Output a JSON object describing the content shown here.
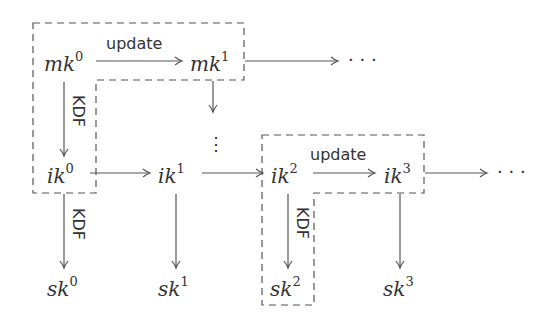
{
  "nodes": {
    "mk0": {
      "base": "mk",
      "sup": "0"
    },
    "mk1": {
      "base": "mk",
      "sup": "1"
    },
    "ik0": {
      "base": "ik",
      "sup": "0"
    },
    "ik1": {
      "base": "ik",
      "sup": "1"
    },
    "ik2": {
      "base": "ik",
      "sup": "2"
    },
    "ik3": {
      "base": "ik",
      "sup": "3"
    },
    "sk0": {
      "base": "sk",
      "sup": "0"
    },
    "sk1": {
      "base": "sk",
      "sup": "1"
    },
    "sk2": {
      "base": "sk",
      "sup": "2"
    },
    "sk3": {
      "base": "sk",
      "sup": "3"
    }
  },
  "labels": {
    "update_top": "update",
    "update_bottom": "update",
    "kdf_top": "KDF",
    "kdf_mid": "KDF",
    "kdf_right": "KDF"
  },
  "ellipsis": {
    "top_row": "· · ·",
    "bottom_row": "· · ·",
    "vertical": "⋮"
  }
}
